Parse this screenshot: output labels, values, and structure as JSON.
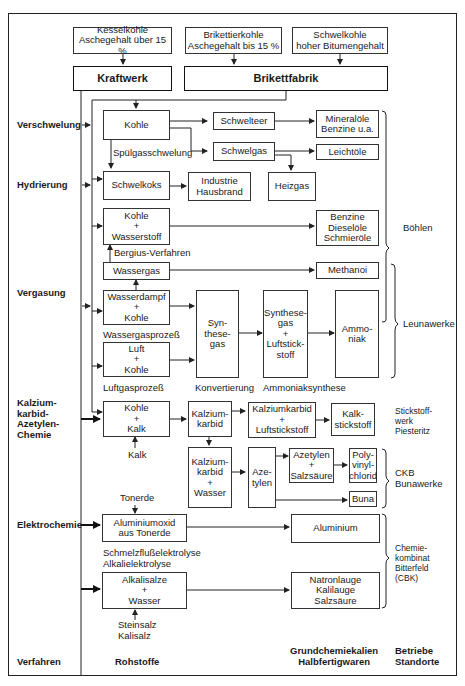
{
  "sources": {
    "kesselkohle": "Kesselkohle\nAschegehalt über 15 %",
    "brikettierkohle": "Brikettierkohle\nAschegehalt bis 15 %",
    "schwelkohle": "Schwelkohle\nhoher Bitumengehalt"
  },
  "plants": {
    "kraftwerk": "Kraftwerk",
    "brikettfabrik": "Brikettfabrik"
  },
  "processes": {
    "verschwelung": "Verschwelung",
    "hydrierung": "Hydrierung",
    "vergasung": "Vergasung",
    "kalziumkarbid": "Kalzium-\nkarbid-\nAzetylen-\nChemie",
    "elektrochemie": "Elektrochemie"
  },
  "raw_materials": {
    "kohle": "Kohle",
    "schwelkoks": "Schwelkoks",
    "kohle_wasserstoff": "Kohle\n+\nWasserstoff",
    "wassergas": "Wassergas",
    "wasserdampf_kohle": "Wasserdampf\n+\nKohle",
    "luft_kohle": "Luft\n+\nKohle",
    "kohle_kalk": "Kohle\n+\nKalk",
    "aluminiumoxid": "Aluminiumoxid\naus Tonerde",
    "alkalisalze": "Alkalisalze\n+\nWasser"
  },
  "intermediates": {
    "schwelteer": "Schwelteer",
    "schwelgas": "Schwelgas",
    "industrie_hausbrand": "Industrie\nHausbrand",
    "heizgas": "Heizgas",
    "synthesegas": "Syn-\nthese-\ngas",
    "synthesegas_luftstickstoff": "Synthese-\ngas\n+\nLuftstick-\nstoff",
    "kalziumkarbid": "Kalzium-\nkarbid",
    "kalziumkarbid_wasser": "Kalzium-\nkarbid\n+\nWasser",
    "kalziumkarbid_luftstickstoff": "Kalziumkarbid\n+\nLuftstickstoff",
    "azetylen": "Aze-\ntylen",
    "azetylen_salzsaeure": "Azetylen\n+\nSalzsäure"
  },
  "products": {
    "mineraloele": "Mineralöle\nBenzine u.a.",
    "leichtoele": "Leichtöle",
    "benzine": "Benzine\nDieselöle\nSchmieröle",
    "methanol": "Methanoi",
    "ammoniak": "Ammo-\nniak",
    "kalkstickstoff": "Kalk-\nstickstoff",
    "pvc": "Poly-\nvinyl-\nchlorid",
    "buna": "Buna",
    "aluminium": "Aluminium",
    "natronlauge": "Natronlauge\nKalilauge\nSalzsäure"
  },
  "process_labels": {
    "spuelgasschwelung": "Spülgasschwelung",
    "bergius": "Bergius-Verfahren",
    "wassergasprozess": "Wassergasprozeß",
    "luftgasprozess": "Luftgasprozeß",
    "konvertierung": "Konvertierung",
    "ammoniaksynthese": "Ammoniaksynthese",
    "kalk": "Kalk",
    "tonerde": "Tonerde",
    "elektrolyse": "Schmelzflußelektrolyse\nAlkalielektrolyse",
    "steinsalz": "Steinsalz\nKalisalz"
  },
  "sites": {
    "boehlen": "Böhlen",
    "leunawerke": "Leunawerke",
    "piesteritz": "Stickstoff-\nwerk\nPiesteritz",
    "ckb": "CKB\nBunawerke",
    "cbk": "Chemie-\nkombinat\nBitterfeld\n(CBK)"
  },
  "column_headers": {
    "verfahren": "Verfahren",
    "rohstoffe": "Rohstoffe",
    "grundchemiekalien": "Grundchemiekalien\nHalbfertigwaren",
    "betriebe": "Betriebe\nStandorte"
  }
}
